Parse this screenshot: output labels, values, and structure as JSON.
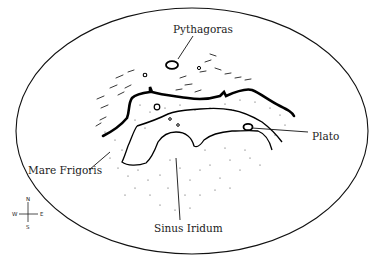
{
  "diagram": {
    "type": "lunar-region-map",
    "labels": {
      "pythagoras": "Pythagoras",
      "plato": "Plato",
      "mare_frigoris": "Mare Frigoris",
      "sinus_iridum": "Sinus Iridum"
    },
    "compass": {
      "north": "N",
      "south": "S",
      "east": "E",
      "west": "W"
    },
    "colors": {
      "ink": "#111111",
      "background": "#ffffff"
    }
  }
}
